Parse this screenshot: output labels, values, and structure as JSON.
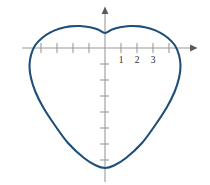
{
  "figure": {
    "width": 210,
    "height": 185,
    "background_color": "#ffffff"
  },
  "chart_data": {
    "type": "line",
    "title": "",
    "subtitle": "",
    "xlabel": "",
    "ylabel": "",
    "legend": [],
    "grid": false,
    "curve_name": "heart-shaped closed curve",
    "curve_color": "#1f4e79",
    "curve_stroke_width": 2.1,
    "axis_color": "#9a9a9a",
    "label_color": "#2b2b2b",
    "origin_px": {
      "x": 105,
      "y": 48
    },
    "unit_px": 16,
    "xlim": [
      -5.2,
      5.6
    ],
    "ylim": [
      -8.4,
      2.5
    ],
    "x_axis": {
      "pixel_start": 22,
      "pixel_end": 195,
      "arrow": "right",
      "tick_values": [
        -4,
        -3,
        -2,
        -1,
        1,
        2,
        3,
        4
      ],
      "tick_labels": [
        "",
        "",
        "",
        "",
        "1",
        "2",
        "3",
        ""
      ],
      "labeled_ticks": [
        {
          "value": 1,
          "label": "1"
        },
        {
          "value": 2,
          "label": "2"
        },
        {
          "value": 3,
          "label": "3"
        }
      ]
    },
    "y_axis": {
      "pixel_start": 8,
      "pixel_end": 182,
      "arrow": "up",
      "tick_values": [
        -1,
        -2,
        -3,
        -4,
        -5,
        -6,
        -7
      ],
      "tick_labels": [
        "",
        "",
        "",
        "",
        "",
        "",
        ""
      ],
      "labeled_ticks": []
    },
    "curve_points_px": [
      [
        105,
        33
      ],
      [
        98,
        29.5
      ],
      [
        90,
        27.2
      ],
      [
        80,
        26.0
      ],
      [
        70,
        26.4
      ],
      [
        60,
        28.6
      ],
      [
        50,
        32.6
      ],
      [
        42,
        38.0
      ],
      [
        35,
        45.5
      ],
      [
        31,
        55.0
      ],
      [
        29.5,
        66.0
      ],
      [
        31.0,
        78.0
      ],
      [
        35.5,
        92.0
      ],
      [
        43.0,
        107.0
      ],
      [
        54.0,
        124.0
      ],
      [
        68.0,
        143.0
      ],
      [
        84.0,
        158.0
      ],
      [
        96.0,
        165.5
      ],
      [
        105,
        168.0
      ],
      [
        114.0,
        165.5
      ],
      [
        126.0,
        158.0
      ],
      [
        142.0,
        143.0
      ],
      [
        156.0,
        124.0
      ],
      [
        167.0,
        107.0
      ],
      [
        174.5,
        92.0
      ],
      [
        179.0,
        78.0
      ],
      [
        180.5,
        66.0
      ],
      [
        179.0,
        55.0
      ],
      [
        175.0,
        45.5
      ],
      [
        168.0,
        38.0
      ],
      [
        160.0,
        32.6
      ],
      [
        150.0,
        28.6
      ],
      [
        140.0,
        26.4
      ],
      [
        130.0,
        26.0
      ],
      [
        120.0,
        27.2
      ],
      [
        112.0,
        29.5
      ],
      [
        105,
        33
      ]
    ],
    "features": {
      "top_left_lobe_peak_px": [
        80,
        26.0
      ],
      "top_right_lobe_peak_px": [
        130,
        26.0
      ],
      "center_notch_px": [
        105,
        33
      ],
      "bottom_px": [
        105,
        168
      ],
      "left_extreme_px": [
        29.5,
        66
      ],
      "right_extreme_px": [
        180.5,
        66
      ]
    }
  }
}
